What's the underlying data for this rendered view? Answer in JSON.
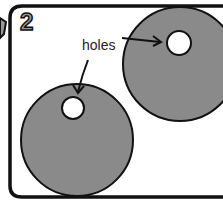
{
  "step": {
    "number": "2"
  },
  "label": {
    "text": "holes"
  },
  "colors": {
    "disc": "#8a8a8a",
    "outline": "#111111",
    "step_fill": "#9a9a9a",
    "background": "#ffffff"
  }
}
